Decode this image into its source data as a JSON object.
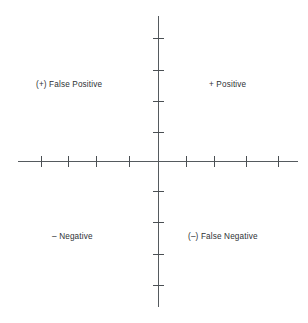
{
  "diagram": {
    "background_color": "#ffffff",
    "axis_color": "#555a5e",
    "tick_color": "#4a4f53",
    "label_color": "#2e3135"
  },
  "axes": {
    "origin": {
      "x": 158,
      "y": 161
    },
    "vertical": {
      "x": 158,
      "y_start": 16,
      "y_end": 307
    },
    "horizontal": {
      "y": 161,
      "x_start": 18,
      "x_end": 298
    },
    "tick_length": 11,
    "ticks_per_side": 4,
    "horizontal_tick_x": [
      41,
      68,
      96,
      129,
      186,
      214,
      246,
      278
    ],
    "vertical_tick_y": [
      38,
      70,
      101,
      132,
      191,
      222,
      254,
      285
    ]
  },
  "quadrants": {
    "top_left": {
      "label": "(+) False Positive",
      "sign": "+",
      "kind": "False Positive"
    },
    "top_right": {
      "label": "+ Positive",
      "sign": "+",
      "kind": "Positive"
    },
    "bottom_left": {
      "label": "– Negative",
      "sign": "–",
      "kind": "Negative"
    },
    "bottom_right": {
      "label": "(–) False Negative",
      "sign": "–",
      "kind": "False Negative"
    }
  }
}
